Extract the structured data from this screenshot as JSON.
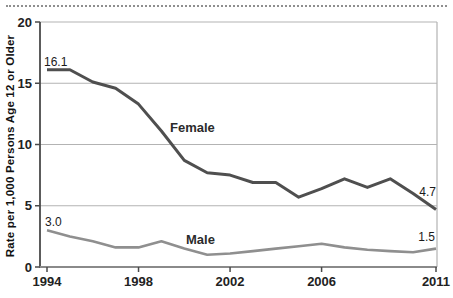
{
  "chart_data": {
    "type": "line",
    "title": "",
    "ylabel": "Rate per 1,000 Persons Age 12 or Older",
    "xlabel": "",
    "ylim": [
      0,
      20
    ],
    "grid": "horizontal gridlines at each y tick, light gray; plot border on right and top",
    "legend_position": "inline labels next to lines",
    "years": [
      1994,
      1995,
      1996,
      1997,
      1998,
      1999,
      2000,
      2001,
      2002,
      2003,
      2004,
      2005,
      2006,
      2007,
      2008,
      2009,
      2010,
      2011
    ],
    "x_ticks": [
      "1994",
      "1998",
      "2002",
      "2006",
      "2011"
    ],
    "x_tick_years": [
      1994,
      1998,
      2002,
      2006,
      2011
    ],
    "y_ticks": [
      "0",
      "5",
      "10",
      "15",
      "20"
    ],
    "y_tick_values": [
      0,
      5,
      10,
      15,
      20
    ],
    "series": [
      {
        "name": "Female",
        "color": "#4f4f4f",
        "stroke_width": 3,
        "values": [
          16.1,
          16.1,
          15.1,
          14.6,
          13.3,
          11.1,
          8.7,
          7.7,
          7.5,
          6.9,
          6.9,
          5.7,
          6.4,
          7.2,
          6.5,
          7.2,
          6.0,
          4.7
        ],
        "first_point_label": "16.1",
        "last_point_label": "4.7"
      },
      {
        "name": "Male",
        "color": "#8f8f8f",
        "stroke_width": 2.6,
        "values": [
          3.0,
          2.5,
          2.1,
          1.6,
          1.6,
          2.1,
          1.5,
          1.0,
          1.1,
          1.3,
          1.5,
          1.7,
          1.9,
          1.6,
          1.4,
          1.3,
          1.2,
          1.5
        ],
        "first_point_label": "3.0",
        "last_point_label": "1.5"
      }
    ],
    "colors": {
      "female_line": "#4f4f4f",
      "male_line": "#8f8f8f",
      "gridline": "#b3b3b3",
      "axis": "#4a4a4a",
      "bottom_axis": "#8a8a8a",
      "text": "#1a1a1a"
    }
  }
}
